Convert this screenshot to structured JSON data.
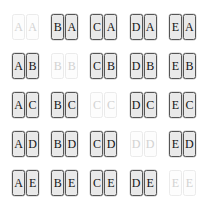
{
  "grid": {
    "rows": 5,
    "columns": 5,
    "row_letters": [
      "A",
      "B",
      "C",
      "D",
      "E"
    ],
    "column_letters": [
      "A",
      "B",
      "C",
      "D",
      "E"
    ],
    "colors": {
      "background": "#ffffff",
      "tile_fill": "#e9e9e9",
      "tile_border": "#555555",
      "tile_text": "#141414",
      "faded_tile_fill": "#fdfdfd",
      "faded_tile_border": "#ebebeb",
      "faded_tile_text": "#d2d2d2"
    },
    "cells": [
      {
        "row": 1,
        "col": 1,
        "left": "A",
        "right": "A",
        "faded": true
      },
      {
        "row": 1,
        "col": 2,
        "left": "B",
        "right": "A",
        "faded": false
      },
      {
        "row": 1,
        "col": 3,
        "left": "C",
        "right": "A",
        "faded": false
      },
      {
        "row": 1,
        "col": 4,
        "left": "D",
        "right": "A",
        "faded": false
      },
      {
        "row": 1,
        "col": 5,
        "left": "E",
        "right": "A",
        "faded": false
      },
      {
        "row": 2,
        "col": 1,
        "left": "A",
        "right": "B",
        "faded": false
      },
      {
        "row": 2,
        "col": 2,
        "left": "B",
        "right": "B",
        "faded": true
      },
      {
        "row": 2,
        "col": 3,
        "left": "C",
        "right": "B",
        "faded": false
      },
      {
        "row": 2,
        "col": 4,
        "left": "D",
        "right": "B",
        "faded": false
      },
      {
        "row": 2,
        "col": 5,
        "left": "E",
        "right": "B",
        "faded": false
      },
      {
        "row": 3,
        "col": 1,
        "left": "A",
        "right": "C",
        "faded": false
      },
      {
        "row": 3,
        "col": 2,
        "left": "B",
        "right": "C",
        "faded": false
      },
      {
        "row": 3,
        "col": 3,
        "left": "C",
        "right": "C",
        "faded": true
      },
      {
        "row": 3,
        "col": 4,
        "left": "D",
        "right": "C",
        "faded": false
      },
      {
        "row": 3,
        "col": 5,
        "left": "E",
        "right": "C",
        "faded": false
      },
      {
        "row": 4,
        "col": 1,
        "left": "A",
        "right": "D",
        "faded": false
      },
      {
        "row": 4,
        "col": 2,
        "left": "B",
        "right": "D",
        "faded": false
      },
      {
        "row": 4,
        "col": 3,
        "left": "C",
        "right": "D",
        "faded": false
      },
      {
        "row": 4,
        "col": 4,
        "left": "D",
        "right": "D",
        "faded": true
      },
      {
        "row": 4,
        "col": 5,
        "left": "E",
        "right": "D",
        "faded": false
      },
      {
        "row": 5,
        "col": 1,
        "left": "A",
        "right": "E",
        "faded": false
      },
      {
        "row": 5,
        "col": 2,
        "left": "B",
        "right": "E",
        "faded": false
      },
      {
        "row": 5,
        "col": 3,
        "left": "C",
        "right": "E",
        "faded": false
      },
      {
        "row": 5,
        "col": 4,
        "left": "D",
        "right": "E",
        "faded": false
      },
      {
        "row": 5,
        "col": 5,
        "left": "E",
        "right": "E",
        "faded": true
      }
    ]
  }
}
